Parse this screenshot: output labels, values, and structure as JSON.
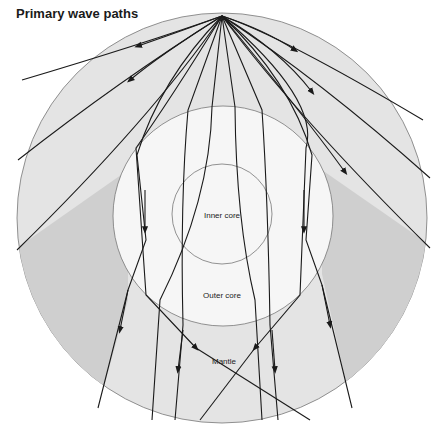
{
  "title": "Primary wave paths",
  "labels": {
    "inner_core": "Inner core",
    "outer_core": "Outer core",
    "mantle": "Mantle"
  },
  "colors": {
    "mantle": "#e4e4e4",
    "shadow_zone": "#cfcfcf",
    "outer_core": "#f6f6f6",
    "ray": "#1a1a1a",
    "outline": "#777777"
  }
}
